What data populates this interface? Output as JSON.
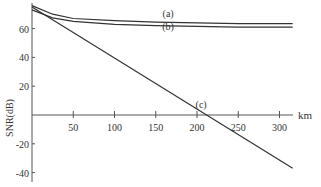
{
  "chart_data": {
    "type": "line",
    "title": "",
    "xlabel": "km",
    "ylabel": "SNR(dB)",
    "xlim": [
      0,
      320
    ],
    "ylim": [
      -45,
      78
    ],
    "x_ticks": [
      50,
      100,
      150,
      200,
      250,
      300
    ],
    "y_ticks": [
      60,
      40,
      20,
      -20,
      -40
    ],
    "grid": false,
    "legend": "inline labels",
    "series": [
      {
        "name": "(a)",
        "x": [
          0,
          25,
          50,
          100,
          150,
          200,
          250,
          316
        ],
        "y": [
          76,
          70,
          67,
          65.5,
          64.5,
          64,
          63.5,
          63.5
        ]
      },
      {
        "name": "(b)",
        "x": [
          0,
          25,
          50,
          100,
          150,
          200,
          250,
          316
        ],
        "y": [
          73,
          67.5,
          65,
          63,
          62,
          61.5,
          61,
          61
        ]
      },
      {
        "name": "(c)",
        "x": [
          0,
          316
        ],
        "y": [
          75,
          -37
        ]
      }
    ],
    "annotations": [
      {
        "text": "(a)",
        "x": 165,
        "y": 68
      },
      {
        "text": "(b)",
        "x": 165,
        "y": 59
      },
      {
        "text": "(c)",
        "x": 205,
        "y": 5
      }
    ]
  }
}
